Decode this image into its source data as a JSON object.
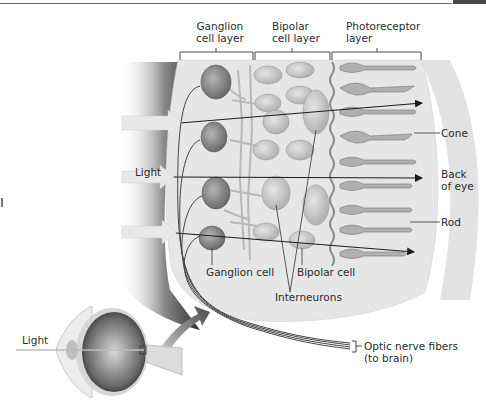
{
  "figure": {
    "layer_headers": [
      {
        "line1": "Ganglion",
        "line2": "cell layer"
      },
      {
        "line1": "Bipolar",
        "line2": "cell layer"
      },
      {
        "line1": "Photoreceptor",
        "line2": "layer"
      }
    ],
    "right_labels": {
      "cone": "Cone",
      "back_of_eye_1": "Back",
      "back_of_eye_2": "of eye",
      "rod": "Rod"
    },
    "left_labels": {
      "light_retina": "Light",
      "light_eye": "Light"
    },
    "bottom_labels": {
      "ganglion_cell": "Ganglion cell",
      "bipolar_cell": "Bipolar cell",
      "interneurons": "Interneurons",
      "optic_nerve_1": "Optic nerve fibers",
      "optic_nerve_2": "(to brain)"
    },
    "colors": {
      "tissue_bg": "#e4e4e4",
      "shadow": "#3a3a3a",
      "cell_fill": "#8c8c8c",
      "label_text": "#2b2b2b",
      "arrow": "#1a1a1a"
    }
  }
}
